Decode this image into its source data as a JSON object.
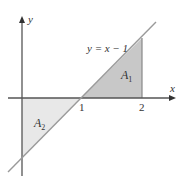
{
  "diagram": {
    "x_axis_label": "x",
    "y_axis_label": "y",
    "equation": "y = x − 1",
    "region_1": {
      "name": "A",
      "sub": "1",
      "color": "#c4c4c4"
    },
    "region_2": {
      "name": "A",
      "sub": "2",
      "color": "#e6e6e6"
    },
    "ticks": [
      {
        "label": "1",
        "value": 1
      },
      {
        "label": "2",
        "value": 2
      }
    ],
    "colors": {
      "axis": "#555555",
      "line": "#999999",
      "text": "#333333"
    }
  }
}
